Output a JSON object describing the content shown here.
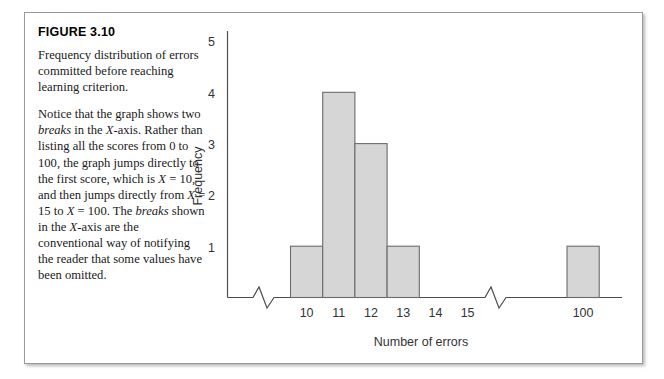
{
  "figure": {
    "label": "FIGURE 3.10",
    "caption_paragraphs": [
      "Frequency distribution of errors committed before reaching learning criterion.",
      "Notice that the graph shows two breaks in the X-axis. Rather than listing all the scores from 0 to 100, the graph jumps directly to the first score, which is X = 10, and then jumps directly from X = 15 to X = 100. The breaks shown in the X-axis are the conventional way of notifying the reader that some values have been omitted."
    ]
  },
  "chart_data": {
    "type": "bar",
    "title": "",
    "xlabel": "Number of errors",
    "ylabel": "Frequency",
    "categories": [
      "10",
      "11",
      "12",
      "13",
      "14",
      "15",
      "100"
    ],
    "values": [
      1,
      4,
      3,
      1,
      0,
      0,
      1
    ],
    "bars": [
      {
        "category": "10",
        "value": 1
      },
      {
        "category": "11",
        "value": 4
      },
      {
        "category": "12",
        "value": 3
      },
      {
        "category": "13",
        "value": 1
      },
      {
        "category": "100",
        "value": 1
      }
    ],
    "x_tick_labels": [
      "10",
      "11",
      "12",
      "13",
      "14",
      "15",
      "100"
    ],
    "y_tick_labels": [
      "1",
      "2",
      "3",
      "4",
      "5"
    ],
    "ylim": [
      0,
      5
    ],
    "grid": false,
    "legend": false,
    "axis_breaks": 2,
    "colors": {
      "bar_fill": "#d6d6d6",
      "bar_stroke": "#6b6b6b",
      "axis": "#4d4d4d",
      "text": "#333333"
    }
  }
}
